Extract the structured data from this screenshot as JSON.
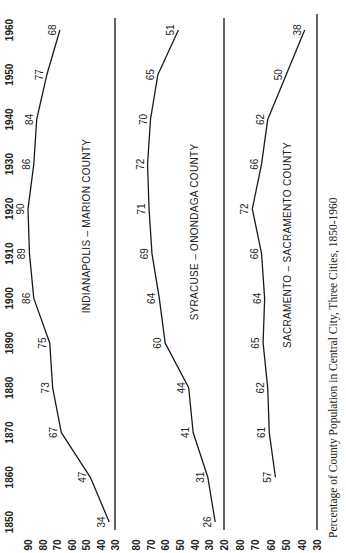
{
  "chart_data": {
    "type": "line",
    "title": "Percentage of County Population in Central City, Three Cities, 1850-1960",
    "orientation": "rotated-90-ccw",
    "x": [
      1850,
      1860,
      1870,
      1880,
      1890,
      1900,
      1910,
      1920,
      1930,
      1940,
      1950,
      1960
    ],
    "xlabel": "Year",
    "ylabel": "Percent",
    "panels": [
      {
        "name": "INDIANAPOLIS – MARION COUNTY",
        "yticks": [
          90,
          80,
          70,
          60,
          50,
          40,
          30
        ],
        "ylim": [
          30,
          90
        ],
        "values": [
          34,
          47,
          67,
          73,
          75,
          86,
          89,
          90,
          86,
          84,
          77,
          68
        ]
      },
      {
        "name": "SYRACUSE – ONONDAGA COUNTY",
        "yticks": [
          80,
          70,
          60,
          50,
          40,
          30,
          20
        ],
        "ylim": [
          20,
          80
        ],
        "values": [
          26,
          31,
          41,
          44,
          60,
          64,
          69,
          71,
          72,
          70,
          65,
          51
        ]
      },
      {
        "name": "SACRAMENTO – SACRAMENTO COUNTY",
        "yticks": [
          80,
          70,
          60,
          50,
          40,
          30
        ],
        "ylim": [
          30,
          80
        ],
        "x": [
          1860,
          1870,
          1880,
          1890,
          1900,
          1910,
          1920,
          1930,
          1940,
          1950,
          1960
        ],
        "values": [
          57,
          61,
          62,
          65,
          64,
          66,
          72,
          66,
          62,
          50,
          38
        ]
      }
    ],
    "year_ticks": [
      "1850",
      "1860",
      "1870",
      "1880",
      "1890",
      "1900",
      "1910",
      "1920",
      "1930",
      "1940",
      "1950",
      "1960"
    ],
    "grid": false,
    "legend": "none (panel labels inline)"
  },
  "labels": {
    "panel1": "INDIANAPOLIS – MARION COUNTY",
    "panel2": "SYRACUSE – ONONDAGA COUNTY",
    "panel3": "SACRAMENTO – SACRAMENTO COUNTY",
    "caption": "Percentage of County Population in Central City, Three Cities, 1850-1960"
  }
}
